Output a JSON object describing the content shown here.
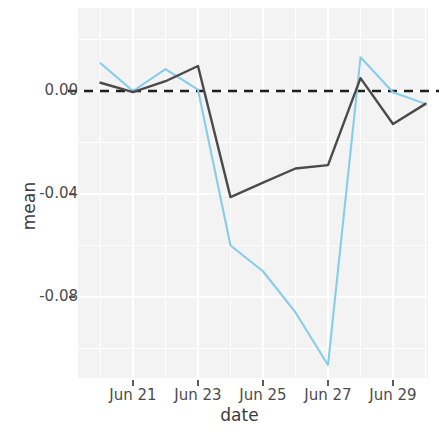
{
  "chart_data": {
    "type": "line",
    "title": "",
    "subtitle": "",
    "xlabel": "date",
    "ylabel": "mean",
    "x": [
      "Jun 20",
      "Jun 21",
      "Jun 22",
      "Jun 23",
      "Jun 24",
      "Jun 25",
      "Jun 26",
      "Jun 27",
      "Jun 28",
      "Jun 29",
      "Jun 30"
    ],
    "xtick_labels": [
      "Jun 21",
      "Jun 23",
      "Jun 25",
      "Jun 27",
      "Jun 29"
    ],
    "xtick_values": [
      "Jun 21",
      "Jun 23",
      "Jun 25",
      "Jun 27",
      "Jun 29"
    ],
    "ytick_labels": [
      "0.00",
      "-0.04",
      "-0.08"
    ],
    "ytick_values": [
      0.0,
      -0.04,
      -0.08
    ],
    "ylim": [
      -0.112,
      0.0155
    ],
    "xlim": [
      "Jun 20",
      "Jun 30"
    ],
    "grid": true,
    "legend": "none",
    "reference_line": {
      "y": 0.0,
      "style": "dashed",
      "color": "#1f1f1f"
    },
    "series": [
      {
        "name": "light-blue-series",
        "color": "#87cdea",
        "style": "solid",
        "values": [
          0.0108,
          0.0,
          0.0085,
          0.0005,
          -0.06,
          -0.07,
          -0.086,
          -0.1064,
          0.0131,
          -0.0005,
          -0.005
        ]
      },
      {
        "name": "dark-gray-series",
        "color": "#4a4a4a",
        "style": "solid",
        "values": [
          0.0032,
          -0.0004,
          0.0038,
          0.0097,
          -0.0412,
          -0.0356,
          -0.0301,
          -0.0288,
          0.005,
          -0.0128,
          -0.005
        ]
      }
    ]
  },
  "axes": {
    "ylabel": "mean",
    "xlabel": "date",
    "yticks": [
      {
        "label": "0.00",
        "value": 0.0
      },
      {
        "label": "-0.04",
        "value": -0.04
      },
      {
        "label": "-0.08",
        "value": -0.08
      }
    ],
    "xticks": [
      {
        "label": "Jun 21"
      },
      {
        "label": "Jun 23"
      },
      {
        "label": "Jun 25"
      },
      {
        "label": "Jun 27"
      },
      {
        "label": "Jun 29"
      }
    ]
  },
  "colors": {
    "series_blue": "#87cdea",
    "series_dark": "#4a4a4a",
    "zero_line": "#1f1f1f",
    "panel_background": "#f3f3f3",
    "grid_major": "#ffffff",
    "text": "#4b4b4b"
  }
}
